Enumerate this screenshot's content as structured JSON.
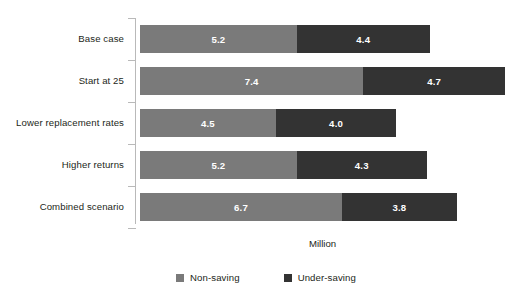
{
  "chart_data": {
    "type": "bar",
    "subtype": "stacked-horizontal",
    "title": "",
    "xlabel": "Million",
    "ylabel": "",
    "grid": false,
    "legend_position": "bottom-center",
    "xlim": [
      0,
      12.1
    ],
    "categories": [
      "Base case",
      "Start at 25",
      "Lower replacement rates",
      "Higher returns",
      "Combined scenario"
    ],
    "series": [
      {
        "name": "Non-saving",
        "color": "#7a7a7a",
        "values": [
          5.2,
          7.4,
          4.5,
          5.2,
          6.7
        ],
        "labels": [
          "5.2",
          "7.4",
          "4.5",
          "5.2",
          "6.7"
        ]
      },
      {
        "name": "Under-saving",
        "color": "#333333",
        "values": [
          4.4,
          4.7,
          4.0,
          4.3,
          3.8
        ],
        "labels": [
          "4.4",
          "4.7",
          "4.0",
          "4.3",
          "3.8"
        ]
      }
    ],
    "totals": [
      9.6,
      12.1,
      8.5,
      9.5,
      10.5
    ]
  },
  "axis": {
    "x_title": "Million",
    "line_color": "#b9b9b9"
  },
  "legend": {
    "items": [
      {
        "label": "Non-saving",
        "color": "#7a7a7a"
      },
      {
        "label": "Under-saving",
        "color": "#333333"
      }
    ]
  }
}
